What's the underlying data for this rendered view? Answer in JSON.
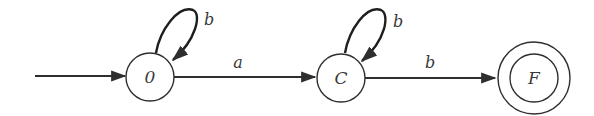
{
  "diagram": {
    "type": "finite-automaton",
    "colors": {
      "stroke": "#2e2e2e",
      "text": "#3a3a3a",
      "background": "#ffffff"
    },
    "states": [
      {
        "id": "s0",
        "label": "0",
        "start": true,
        "accepting": false
      },
      {
        "id": "C",
        "label": "C",
        "start": false,
        "accepting": false
      },
      {
        "id": "F",
        "label": "F",
        "start": false,
        "accepting": true
      }
    ],
    "transitions": [
      {
        "from": "0",
        "to": "0",
        "label": "b"
      },
      {
        "from": "0",
        "to": "C",
        "label": "a"
      },
      {
        "from": "C",
        "to": "C",
        "label": "b"
      },
      {
        "from": "C",
        "to": "F",
        "label": "b"
      }
    ]
  }
}
